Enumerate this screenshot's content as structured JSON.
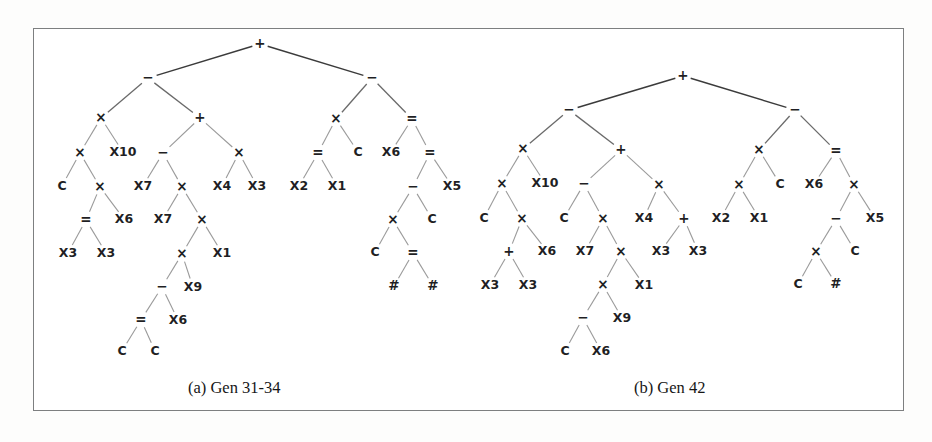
{
  "figure": {
    "background_color": "#ffffff",
    "border_color": "#7d7f80",
    "edge_color": "#9a9a9a",
    "text_color": "#1f1f24"
  },
  "captions": {
    "a": "(a) Gen 31-34",
    "b": "(b) Gen 42"
  },
  "trees": [
    {
      "id": "tree-a",
      "caption": "(a) Gen 31-34",
      "nodes": [
        {
          "id": "a0",
          "label": "+",
          "x": 260,
          "y": 44,
          "depth": 0
        },
        {
          "id": "a1",
          "label": "−",
          "x": 148,
          "y": 78,
          "depth": 1
        },
        {
          "id": "a2",
          "label": "−",
          "x": 372,
          "y": 78,
          "depth": 1
        },
        {
          "id": "a3",
          "label": "×",
          "x": 101,
          "y": 118,
          "depth": 2
        },
        {
          "id": "a4",
          "label": "+",
          "x": 200,
          "y": 118,
          "depth": 2
        },
        {
          "id": "a5",
          "label": "×",
          "x": 336,
          "y": 119,
          "depth": 2
        },
        {
          "id": "a6",
          "label": "=",
          "x": 412,
          "y": 119,
          "depth": 2
        },
        {
          "id": "a7",
          "label": "×",
          "x": 80,
          "y": 153,
          "depth": 3
        },
        {
          "id": "a8",
          "label": "X10",
          "x": 123,
          "y": 152,
          "depth": 3
        },
        {
          "id": "a9",
          "label": "−",
          "x": 163,
          "y": 153,
          "depth": 3
        },
        {
          "id": "a10",
          "label": "×",
          "x": 239,
          "y": 153,
          "depth": 3
        },
        {
          "id": "a11",
          "label": "=",
          "x": 318,
          "y": 153,
          "depth": 3
        },
        {
          "id": "a12",
          "label": "C",
          "x": 358,
          "y": 152,
          "depth": 3
        },
        {
          "id": "a13",
          "label": "X6",
          "x": 391,
          "y": 152,
          "depth": 3
        },
        {
          "id": "a14",
          "label": "=",
          "x": 430,
          "y": 153,
          "depth": 3
        },
        {
          "id": "a15",
          "label": "C",
          "x": 62,
          "y": 186,
          "depth": 4
        },
        {
          "id": "a16",
          "label": "×",
          "x": 100,
          "y": 187,
          "depth": 4
        },
        {
          "id": "a17",
          "label": "X7",
          "x": 143,
          "y": 186,
          "depth": 4
        },
        {
          "id": "a18",
          "label": "×",
          "x": 182,
          "y": 187,
          "depth": 4
        },
        {
          "id": "a19",
          "label": "X4",
          "x": 222,
          "y": 186,
          "depth": 4
        },
        {
          "id": "a20",
          "label": "X3",
          "x": 257,
          "y": 186,
          "depth": 4
        },
        {
          "id": "a21",
          "label": "X2",
          "x": 299,
          "y": 186,
          "depth": 4
        },
        {
          "id": "a22",
          "label": "X1",
          "x": 337,
          "y": 186,
          "depth": 4
        },
        {
          "id": "a23",
          "label": "−",
          "x": 413,
          "y": 187,
          "depth": 4
        },
        {
          "id": "a24",
          "label": "X5",
          "x": 452,
          "y": 186,
          "depth": 4
        },
        {
          "id": "a25",
          "label": "=",
          "x": 86,
          "y": 220,
          "depth": 5
        },
        {
          "id": "a26",
          "label": "X6",
          "x": 124,
          "y": 219,
          "depth": 5
        },
        {
          "id": "a27",
          "label": "X7",
          "x": 163,
          "y": 219,
          "depth": 5
        },
        {
          "id": "a28",
          "label": "×",
          "x": 202,
          "y": 220,
          "depth": 5
        },
        {
          "id": "a29",
          "label": "×",
          "x": 393,
          "y": 220,
          "depth": 5
        },
        {
          "id": "a30",
          "label": "C",
          "x": 432,
          "y": 219,
          "depth": 5
        },
        {
          "id": "a31",
          "label": "X3",
          "x": 68,
          "y": 253,
          "depth": 6
        },
        {
          "id": "a32",
          "label": "X3",
          "x": 106,
          "y": 253,
          "depth": 6
        },
        {
          "id": "a33",
          "label": "×",
          "x": 182,
          "y": 254,
          "depth": 6
        },
        {
          "id": "a34",
          "label": "X1",
          "x": 222,
          "y": 253,
          "depth": 6
        },
        {
          "id": "a35",
          "label": "C",
          "x": 375,
          "y": 252,
          "depth": 6
        },
        {
          "id": "a36",
          "label": "=",
          "x": 413,
          "y": 253,
          "depth": 6
        },
        {
          "id": "a37",
          "label": "−",
          "x": 162,
          "y": 287,
          "depth": 7
        },
        {
          "id": "a38",
          "label": "X9",
          "x": 193,
          "y": 287,
          "depth": 7
        },
        {
          "id": "a39",
          "label": "#",
          "x": 394,
          "y": 286,
          "depth": 7
        },
        {
          "id": "a40",
          "label": "#",
          "x": 433,
          "y": 286,
          "depth": 7
        },
        {
          "id": "a41",
          "label": "=",
          "x": 141,
          "y": 320,
          "depth": 8
        },
        {
          "id": "a42",
          "label": "X6",
          "x": 178,
          "y": 320,
          "depth": 8
        },
        {
          "id": "a43",
          "label": "C",
          "x": 122,
          "y": 351,
          "depth": 9
        },
        {
          "id": "a44",
          "label": "C",
          "x": 155,
          "y": 351,
          "depth": 9
        }
      ],
      "edges": [
        [
          "a0",
          "a1"
        ],
        [
          "a0",
          "a2"
        ],
        [
          "a1",
          "a3"
        ],
        [
          "a1",
          "a4"
        ],
        [
          "a2",
          "a5"
        ],
        [
          "a2",
          "a6"
        ],
        [
          "a3",
          "a7"
        ],
        [
          "a3",
          "a8"
        ],
        [
          "a4",
          "a9"
        ],
        [
          "a4",
          "a10"
        ],
        [
          "a5",
          "a11"
        ],
        [
          "a5",
          "a12"
        ],
        [
          "a6",
          "a13"
        ],
        [
          "a6",
          "a14"
        ],
        [
          "a7",
          "a15"
        ],
        [
          "a7",
          "a16"
        ],
        [
          "a9",
          "a17"
        ],
        [
          "a9",
          "a18"
        ],
        [
          "a10",
          "a19"
        ],
        [
          "a10",
          "a20"
        ],
        [
          "a11",
          "a21"
        ],
        [
          "a11",
          "a22"
        ],
        [
          "a14",
          "a23"
        ],
        [
          "a14",
          "a24"
        ],
        [
          "a16",
          "a25"
        ],
        [
          "a16",
          "a26"
        ],
        [
          "a18",
          "a27"
        ],
        [
          "a18",
          "a28"
        ],
        [
          "a25",
          "a31"
        ],
        [
          "a25",
          "a32"
        ],
        [
          "a28",
          "a33"
        ],
        [
          "a28",
          "a34"
        ],
        [
          "a23",
          "a29"
        ],
        [
          "a23",
          "a30"
        ],
        [
          "a33",
          "a37"
        ],
        [
          "a33",
          "a38"
        ],
        [
          "a29",
          "a35"
        ],
        [
          "a29",
          "a36"
        ],
        [
          "a36",
          "a39"
        ],
        [
          "a36",
          "a40"
        ],
        [
          "a37",
          "a41"
        ],
        [
          "a37",
          "a42"
        ],
        [
          "a41",
          "a43"
        ],
        [
          "a41",
          "a44"
        ]
      ]
    },
    {
      "id": "tree-b",
      "caption": "(b) Gen 42",
      "nodes": [
        {
          "id": "b0",
          "label": "+",
          "x": 683,
          "y": 76,
          "depth": 0
        },
        {
          "id": "b1",
          "label": "−",
          "x": 569,
          "y": 110,
          "depth": 1
        },
        {
          "id": "b2",
          "label": "−",
          "x": 795,
          "y": 110,
          "depth": 1
        },
        {
          "id": "b3",
          "label": "×",
          "x": 523,
          "y": 149,
          "depth": 2
        },
        {
          "id": "b4",
          "label": "+",
          "x": 621,
          "y": 150,
          "depth": 2
        },
        {
          "id": "b5",
          "label": "×",
          "x": 759,
          "y": 150,
          "depth": 2
        },
        {
          "id": "b6",
          "label": "=",
          "x": 836,
          "y": 151,
          "depth": 2
        },
        {
          "id": "b7",
          "label": "×",
          "x": 502,
          "y": 184,
          "depth": 3
        },
        {
          "id": "b8",
          "label": "X10",
          "x": 545,
          "y": 183,
          "depth": 3
        },
        {
          "id": "b9",
          "label": "−",
          "x": 584,
          "y": 184,
          "depth": 3
        },
        {
          "id": "b10",
          "label": "×",
          "x": 659,
          "y": 185,
          "depth": 3
        },
        {
          "id": "b11",
          "label": "×",
          "x": 739,
          "y": 185,
          "depth": 3
        },
        {
          "id": "b12",
          "label": "C",
          "x": 780,
          "y": 184,
          "depth": 3
        },
        {
          "id": "b13",
          "label": "X6",
          "x": 814,
          "y": 184,
          "depth": 3
        },
        {
          "id": "b14",
          "label": "×",
          "x": 854,
          "y": 185,
          "depth": 3
        },
        {
          "id": "b15",
          "label": "C",
          "x": 484,
          "y": 218,
          "depth": 4
        },
        {
          "id": "b16",
          "label": "×",
          "x": 522,
          "y": 219,
          "depth": 4
        },
        {
          "id": "b17",
          "label": "C",
          "x": 564,
          "y": 218,
          "depth": 4
        },
        {
          "id": "b18",
          "label": "×",
          "x": 603,
          "y": 219,
          "depth": 4
        },
        {
          "id": "b19",
          "label": "X4",
          "x": 644,
          "y": 218,
          "depth": 4
        },
        {
          "id": "b20",
          "label": "+",
          "x": 684,
          "y": 219,
          "depth": 4
        },
        {
          "id": "b21",
          "label": "X2",
          "x": 721,
          "y": 218,
          "depth": 4
        },
        {
          "id": "b22",
          "label": "X1",
          "x": 759,
          "y": 218,
          "depth": 4
        },
        {
          "id": "b23",
          "label": "−",
          "x": 836,
          "y": 219,
          "depth": 4
        },
        {
          "id": "b24",
          "label": "X5",
          "x": 875,
          "y": 218,
          "depth": 4
        },
        {
          "id": "b25",
          "label": "+",
          "x": 509,
          "y": 252,
          "depth": 5
        },
        {
          "id": "b26",
          "label": "X6",
          "x": 547,
          "y": 251,
          "depth": 5
        },
        {
          "id": "b27",
          "label": "X7",
          "x": 585,
          "y": 251,
          "depth": 5
        },
        {
          "id": "b28",
          "label": "×",
          "x": 621,
          "y": 252,
          "depth": 5
        },
        {
          "id": "b29",
          "label": "X3",
          "x": 661,
          "y": 251,
          "depth": 5
        },
        {
          "id": "b30",
          "label": "X3",
          "x": 698,
          "y": 251,
          "depth": 5
        },
        {
          "id": "b31",
          "label": "×",
          "x": 816,
          "y": 252,
          "depth": 5
        },
        {
          "id": "b32",
          "label": "C",
          "x": 855,
          "y": 251,
          "depth": 5
        },
        {
          "id": "b33",
          "label": "X3",
          "x": 490,
          "y": 285,
          "depth": 6
        },
        {
          "id": "b34",
          "label": "X3",
          "x": 528,
          "y": 285,
          "depth": 6
        },
        {
          "id": "b35",
          "label": "×",
          "x": 603,
          "y": 285,
          "depth": 6
        },
        {
          "id": "b36",
          "label": "X1",
          "x": 644,
          "y": 285,
          "depth": 6
        },
        {
          "id": "b37",
          "label": "C",
          "x": 798,
          "y": 284,
          "depth": 6
        },
        {
          "id": "b38",
          "label": "#",
          "x": 836,
          "y": 284,
          "depth": 6
        },
        {
          "id": "b39",
          "label": "−",
          "x": 583,
          "y": 318,
          "depth": 7
        },
        {
          "id": "b40",
          "label": "X9",
          "x": 622,
          "y": 318,
          "depth": 7
        },
        {
          "id": "b41",
          "label": "C",
          "x": 565,
          "y": 351,
          "depth": 8
        },
        {
          "id": "b42",
          "label": "X6",
          "x": 601,
          "y": 351,
          "depth": 8
        }
      ],
      "edges": [
        [
          "b0",
          "b1"
        ],
        [
          "b0",
          "b2"
        ],
        [
          "b1",
          "b3"
        ],
        [
          "b1",
          "b4"
        ],
        [
          "b2",
          "b5"
        ],
        [
          "b2",
          "b6"
        ],
        [
          "b3",
          "b7"
        ],
        [
          "b3",
          "b8"
        ],
        [
          "b4",
          "b9"
        ],
        [
          "b4",
          "b10"
        ],
        [
          "b5",
          "b11"
        ],
        [
          "b5",
          "b12"
        ],
        [
          "b6",
          "b13"
        ],
        [
          "b6",
          "b14"
        ],
        [
          "b7",
          "b15"
        ],
        [
          "b7",
          "b16"
        ],
        [
          "b9",
          "b17"
        ],
        [
          "b9",
          "b18"
        ],
        [
          "b10",
          "b19"
        ],
        [
          "b10",
          "b20"
        ],
        [
          "b11",
          "b21"
        ],
        [
          "b11",
          "b22"
        ],
        [
          "b14",
          "b23"
        ],
        [
          "b14",
          "b24"
        ],
        [
          "b16",
          "b25"
        ],
        [
          "b16",
          "b26"
        ],
        [
          "b18",
          "b27"
        ],
        [
          "b18",
          "b28"
        ],
        [
          "b20",
          "b29"
        ],
        [
          "b20",
          "b30"
        ],
        [
          "b23",
          "b31"
        ],
        [
          "b23",
          "b32"
        ],
        [
          "b25",
          "b33"
        ],
        [
          "b25",
          "b34"
        ],
        [
          "b28",
          "b35"
        ],
        [
          "b28",
          "b36"
        ],
        [
          "b31",
          "b37"
        ],
        [
          "b31",
          "b38"
        ],
        [
          "b35",
          "b39"
        ],
        [
          "b35",
          "b40"
        ],
        [
          "b39",
          "b41"
        ],
        [
          "b39",
          "b42"
        ]
      ]
    }
  ]
}
